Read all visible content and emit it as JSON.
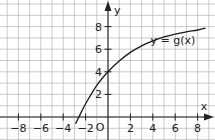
{
  "chart_data": {
    "type": "line",
    "title": "",
    "xlabel": "x",
    "ylabel": "y",
    "origin_label": "O",
    "xlim": [
      -9.6,
      9.5
    ],
    "ylim": [
      -2,
      10.3
    ],
    "grid": true,
    "x_ticks": [
      -8,
      -6,
      -4,
      -2,
      2,
      4,
      6,
      8
    ],
    "x_tick_labels": [
      "−8",
      "−6",
      "−4",
      "−2",
      "2",
      "4",
      "6",
      "8"
    ],
    "y_ticks": [
      2,
      4,
      6,
      8
    ],
    "y_tick_labels": [
      "2",
      "4",
      "6",
      "8"
    ],
    "series": [
      {
        "name": "y = g(x)",
        "label": "y = g(x)",
        "x": [
          -2.9,
          -2.6,
          -2,
          -1,
          0,
          1,
          2,
          3,
          4,
          5,
          6,
          7,
          8,
          8.7
        ],
        "values": [
          -0.6,
          0.0,
          1.17,
          2.8,
          4.0,
          4.95,
          5.72,
          6.3,
          6.74,
          7.08,
          7.34,
          7.54,
          7.7,
          7.87
        ]
      }
    ],
    "annotations": [
      {
        "text": "y = g(x)",
        "x": 6.5,
        "y": 6.8
      }
    ]
  }
}
